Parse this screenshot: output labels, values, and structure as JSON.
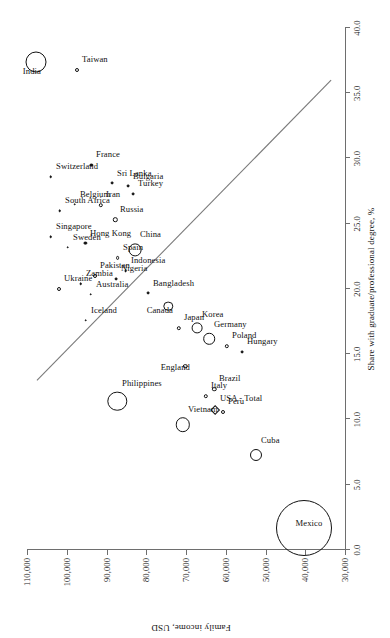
{
  "chart_data": {
    "type": "scatter",
    "title": "",
    "xlabel": "Share with graduate/professional degree, %",
    "ylabel": "Family income, USD",
    "xlim": [
      0.0,
      40.0
    ],
    "ylim": [
      30000,
      110000
    ],
    "xticks": [
      "0.0",
      "5.0",
      "10.0",
      "15.0",
      "20.0",
      "25.0",
      "30.0",
      "35.0",
      "40.0"
    ],
    "xtick_values": [
      0,
      5,
      10,
      15,
      20,
      25,
      30,
      35,
      40
    ],
    "yticks": [
      "30,000",
      "40,000",
      "50,000",
      "60,000",
      "70,000",
      "80,000",
      "90,000",
      "100,000",
      "110,000"
    ],
    "ytick_values": [
      30000,
      40000,
      50000,
      60000,
      70000,
      80000,
      90000,
      100000,
      110000
    ],
    "grid": false,
    "legend": "none",
    "marker_semantics": "bubble area proportional to population size; open circle, filled dot, or diamond",
    "trendline": {
      "x1": 13.0,
      "y1": 107500,
      "x2": 36.0,
      "y2": 33500
    },
    "points": [
      {
        "label": "India",
        "x": 37.4,
        "y": 107800,
        "r": 10.5,
        "style": "open",
        "label_side": "left"
      },
      {
        "label": "Taiwan",
        "x": 36.8,
        "y": 97500,
        "r": 2.0,
        "style": "open",
        "label_side": "right"
      },
      {
        "label": "Switzerland",
        "x": 28.6,
        "y": 104000,
        "r": 1.3,
        "style": "filled",
        "label_side": "right"
      },
      {
        "label": "Singapore",
        "x": 24.0,
        "y": 104000,
        "r": 1.3,
        "style": "filled",
        "label_side": "right"
      },
      {
        "label": "South Africa",
        "x": 26.0,
        "y": 101800,
        "r": 1.3,
        "style": "filled",
        "label_side": "right"
      },
      {
        "label": "Sweden",
        "x": 23.2,
        "y": 99800,
        "r": 1.3,
        "style": "filled",
        "label_side": "right"
      },
      {
        "label": "Belgium",
        "x": 26.5,
        "y": 98000,
        "r": 1.3,
        "style": "filled",
        "label_side": "right"
      },
      {
        "label": "Ukraine",
        "x": 20.0,
        "y": 102000,
        "r": 2.0,
        "style": "open",
        "label_side": "right"
      },
      {
        "label": "Zambia",
        "x": 20.4,
        "y": 96500,
        "r": 1.3,
        "style": "filled",
        "label_side": "right"
      },
      {
        "label": "Hong Kong",
        "x": 23.5,
        "y": 95300,
        "r": 1.6,
        "style": "filled",
        "label_side": "right"
      },
      {
        "label": "Iceland",
        "x": 17.6,
        "y": 95200,
        "r": 1.3,
        "style": "filled",
        "label_side": "right"
      },
      {
        "label": "Australia",
        "x": 19.6,
        "y": 94000,
        "r": 1.3,
        "style": "filled",
        "label_side": "right"
      },
      {
        "label": "Pakistan",
        "x": 21.0,
        "y": 92800,
        "r": 2.0,
        "style": "open",
        "label_side": "right"
      },
      {
        "label": "Iran",
        "x": 26.4,
        "y": 91500,
        "r": 2.2,
        "style": "open",
        "label_side": "right"
      },
      {
        "label": "France",
        "x": 29.5,
        "y": 93800,
        "r": 1.6,
        "style": "filled",
        "label_side": "right"
      },
      {
        "label": "Sri Lanka",
        "x": 28.1,
        "y": 88500,
        "r": 1.4,
        "style": "filled",
        "label_side": "right"
      },
      {
        "label": "Russia",
        "x": 25.3,
        "y": 87800,
        "r": 2.2,
        "style": "open",
        "label_side": "right"
      },
      {
        "label": "Bulgaria",
        "x": 27.9,
        "y": 84600,
        "r": 1.4,
        "style": "filled",
        "label_side": "right"
      },
      {
        "label": "Turkey",
        "x": 27.3,
        "y": 83400,
        "r": 1.4,
        "style": "filled",
        "label_side": "right"
      },
      {
        "label": "Spain",
        "x": 22.4,
        "y": 87200,
        "r": 1.9,
        "style": "open",
        "label_side": "right"
      },
      {
        "label": "Nigeria",
        "x": 20.8,
        "y": 87500,
        "r": 1.4,
        "style": "filled",
        "label_side": "right"
      },
      {
        "label": "Indonesia",
        "x": 21.4,
        "y": 85200,
        "r": 1.4,
        "style": "filled",
        "label_side": "right"
      },
      {
        "label": "China",
        "x": 23.0,
        "y": 82800,
        "r": 6.4,
        "style": "open",
        "label_side": "right"
      },
      {
        "label": "Bangladesh",
        "x": 19.7,
        "y": 79500,
        "r": 1.4,
        "style": "filled",
        "label_side": "right"
      },
      {
        "label": "Canada",
        "x": 18.7,
        "y": 74500,
        "r": 4.7,
        "style": "open",
        "label_side": "left"
      },
      {
        "label": "Japan",
        "x": 17.0,
        "y": 71800,
        "r": 2.2,
        "style": "open",
        "label_side": "right"
      },
      {
        "label": "Korea",
        "x": 17.0,
        "y": 67300,
        "r": 5.4,
        "style": "open",
        "label_side": "right"
      },
      {
        "label": "Germany",
        "x": 16.2,
        "y": 64200,
        "r": 5.8,
        "style": "open",
        "label_side": "right"
      },
      {
        "label": "Poland",
        "x": 15.6,
        "y": 59800,
        "r": 2.2,
        "style": "open",
        "label_side": "right"
      },
      {
        "label": "Hungary",
        "x": 15.2,
        "y": 55800,
        "r": 1.4,
        "style": "filled",
        "label_side": "right"
      },
      {
        "label": "England",
        "x": 14.1,
        "y": 70200,
        "r": 2.2,
        "style": "open",
        "label_side": "left"
      },
      {
        "label": "Italy",
        "x": 11.8,
        "y": 65000,
        "r": 2.2,
        "style": "open",
        "label_side": "right"
      },
      {
        "label": "Brazil",
        "x": 12.3,
        "y": 62900,
        "r": 2.2,
        "style": "open",
        "label_side": "right"
      },
      {
        "label": "USA - Total",
        "x": 10.7,
        "y": 62800,
        "r": 3.4,
        "style": "diamond",
        "label_side": "right"
      },
      {
        "label": "Peru",
        "x": 10.6,
        "y": 60700,
        "r": 2.0,
        "style": "open",
        "label_side": "right"
      },
      {
        "label": "Philippines",
        "x": 11.4,
        "y": 87300,
        "r": 9.7,
        "style": "open",
        "label_side": "right"
      },
      {
        "label": "Vietnam",
        "x": 9.6,
        "y": 70800,
        "r": 7.2,
        "style": "open",
        "label_side": "right"
      },
      {
        "label": "Cuba",
        "x": 7.3,
        "y": 52400,
        "r": 6.0,
        "style": "open",
        "label_side": "right"
      },
      {
        "label": "Mexico",
        "x": 1.7,
        "y": 40300,
        "r": 28.0,
        "style": "open",
        "label_side": "center"
      }
    ]
  }
}
